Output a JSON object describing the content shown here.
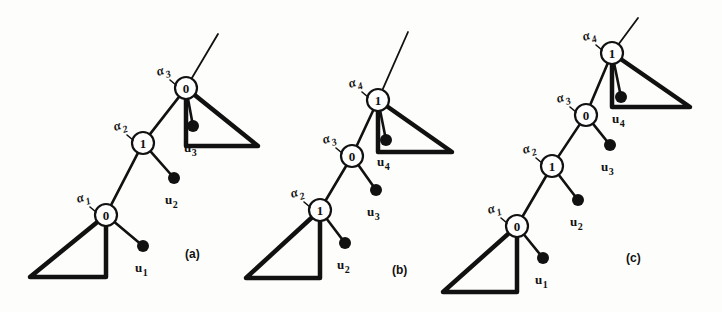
{
  "figure": {
    "background_color": "#fdfdfb",
    "ink_color": "#111111"
  },
  "panels": [
    {
      "id": "a",
      "caption": "(a)",
      "caption_pos": {
        "x": 185,
        "y": 258
      },
      "nodes": [
        {
          "name": "node-a-top",
          "value": "0",
          "cx": 186,
          "cy": 88,
          "r": 11,
          "alpha": {
            "base": "α",
            "sub": "3",
            "x": 158,
            "y": 76
          }
        },
        {
          "name": "node-a-mid",
          "value": "1",
          "cx": 143,
          "cy": 143,
          "r": 11,
          "alpha": {
            "base": "α",
            "sub": "2",
            "x": 115,
            "y": 131
          }
        },
        {
          "name": "node-a-bottom",
          "value": "0",
          "cx": 106,
          "cy": 215,
          "r": 11,
          "alpha": {
            "base": "α",
            "sub": "1",
            "x": 78,
            "y": 203
          }
        }
      ],
      "leaves": [
        {
          "name": "leaf-a-u3",
          "label_base": "u",
          "label_sub": "3",
          "cx": 193,
          "cy": 126,
          "r": 6,
          "lx": 184,
          "ly": 152
        },
        {
          "name": "leaf-a-u2",
          "label_base": "u",
          "label_sub": "2",
          "cx": 174,
          "cy": 178,
          "r": 6,
          "lx": 165,
          "ly": 204
        },
        {
          "name": "leaf-a-u1",
          "label_base": "u",
          "label_sub": "1",
          "cx": 143,
          "cy": 246,
          "r": 6,
          "lx": 135,
          "ly": 272
        }
      ],
      "stem": {
        "x1": 186,
        "y1": 88,
        "x2": 218,
        "y2": 34
      },
      "triangles": [
        {
          "name": "triangle-a-top",
          "apex_x": 186,
          "apex_y": 88,
          "base_y": 146,
          "far_x": 258,
          "orient": "right"
        },
        {
          "name": "triangle-a-bottom",
          "apex_x": 106,
          "apex_y": 215,
          "base_y": 277,
          "far_x": 30,
          "orient": "left"
        }
      ]
    },
    {
      "id": "b",
      "caption": "(b)",
      "caption_pos": {
        "x": 392,
        "y": 274
      },
      "nodes": [
        {
          "name": "node-b-top",
          "value": "1",
          "cx": 378,
          "cy": 100,
          "r": 11,
          "alpha": {
            "base": "α",
            "sub": "4",
            "x": 350,
            "y": 88
          }
        },
        {
          "name": "node-b-mid",
          "value": "0",
          "cx": 352,
          "cy": 156,
          "r": 11,
          "alpha": {
            "base": "α",
            "sub": "3",
            "x": 324,
            "y": 144
          }
        },
        {
          "name": "node-b-bottom",
          "value": "1",
          "cx": 320,
          "cy": 210,
          "r": 11,
          "alpha": {
            "base": "α",
            "sub": "2",
            "x": 292,
            "y": 198
          }
        }
      ],
      "leaves": [
        {
          "name": "leaf-b-u4",
          "label_base": "u",
          "label_sub": "4",
          "cx": 386,
          "cy": 140,
          "r": 6,
          "lx": 377,
          "ly": 166
        },
        {
          "name": "leaf-b-u3",
          "label_base": "u",
          "label_sub": "3",
          "cx": 376,
          "cy": 190,
          "r": 6,
          "lx": 367,
          "ly": 216
        },
        {
          "name": "leaf-b-u2",
          "label_base": "u",
          "label_sub": "2",
          "cx": 345,
          "cy": 243,
          "r": 6,
          "lx": 337,
          "ly": 269
        }
      ],
      "stem": {
        "x1": 378,
        "y1": 100,
        "x2": 408,
        "y2": 32
      },
      "triangles": [
        {
          "name": "triangle-b-top",
          "apex_x": 378,
          "apex_y": 100,
          "base_y": 152,
          "far_x": 452,
          "orient": "right"
        },
        {
          "name": "triangle-b-bottom",
          "apex_x": 320,
          "apex_y": 210,
          "base_y": 278,
          "far_x": 246,
          "orient": "left"
        }
      ]
    },
    {
      "id": "c",
      "caption": "(c)",
      "caption_pos": {
        "x": 626,
        "y": 262
      },
      "nodes": [
        {
          "name": "node-c-top",
          "value": "1",
          "cx": 612,
          "cy": 53,
          "r": 11,
          "alpha": {
            "base": "α",
            "sub": "4",
            "x": 584,
            "y": 41
          }
        },
        {
          "name": "node-c-upmid",
          "value": "0",
          "cx": 586,
          "cy": 115,
          "r": 11,
          "alpha": {
            "base": "α",
            "sub": "3",
            "x": 558,
            "y": 103
          }
        },
        {
          "name": "node-c-lomid",
          "value": "1",
          "cx": 552,
          "cy": 166,
          "r": 11,
          "alpha": {
            "base": "α",
            "sub": "2",
            "x": 524,
            "y": 154
          }
        },
        {
          "name": "node-c-bottom",
          "value": "0",
          "cx": 517,
          "cy": 226,
          "r": 11,
          "alpha": {
            "base": "α",
            "sub": "1",
            "x": 489,
            "y": 214
          }
        }
      ],
      "leaves": [
        {
          "name": "leaf-c-u4",
          "label_base": "u",
          "label_sub": "4",
          "cx": 621,
          "cy": 97,
          "r": 6,
          "lx": 612,
          "ly": 123
        },
        {
          "name": "leaf-c-u3",
          "label_base": "u",
          "label_sub": "3",
          "cx": 610,
          "cy": 145,
          "r": 6,
          "lx": 601,
          "ly": 171
        },
        {
          "name": "leaf-c-u2",
          "label_base": "u",
          "label_sub": "2",
          "cx": 578,
          "cy": 200,
          "r": 6,
          "lx": 570,
          "ly": 226
        },
        {
          "name": "leaf-c-u1",
          "label_base": "u",
          "label_sub": "1",
          "cx": 543,
          "cy": 258,
          "r": 6,
          "lx": 535,
          "ly": 284
        }
      ],
      "stem": {
        "x1": 612,
        "y1": 53,
        "x2": 638,
        "y2": 18
      },
      "triangles": [
        {
          "name": "triangle-c-top",
          "apex_x": 612,
          "apex_y": 53,
          "base_y": 107,
          "far_x": 690,
          "orient": "right"
        },
        {
          "name": "triangle-c-bottom",
          "apex_x": 517,
          "apex_y": 226,
          "base_y": 292,
          "far_x": 443,
          "orient": "left"
        }
      ]
    }
  ]
}
